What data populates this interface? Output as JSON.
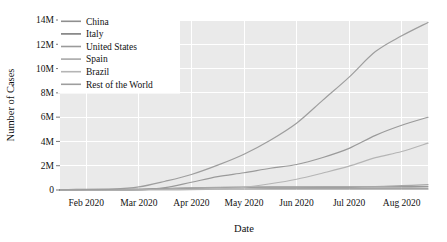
{
  "chart_data": {
    "type": "line",
    "title": "",
    "xlabel": "Date",
    "ylabel": "Number of Cases",
    "grid": true,
    "legend_position": "top-left",
    "x_tick_labels": [
      "Feb 2020",
      "Mar 2020",
      "Apr 2020",
      "May 2020",
      "Jun 2020",
      "Jul 2020",
      "Aug 2020"
    ],
    "y_tick_labels": [
      "0",
      "2M",
      "4M",
      "6M",
      "8M",
      "10M",
      "12M",
      "14M"
    ],
    "y_tick_values": [
      0,
      2000000,
      4000000,
      6000000,
      8000000,
      10000000,
      12000000,
      14000000
    ],
    "ylim": [
      0,
      14000000
    ],
    "xlim": [
      "2020-02-01",
      "2020-08-31"
    ],
    "x": [
      "2020-02-01",
      "2020-02-15",
      "2020-03-01",
      "2020-03-15",
      "2020-04-01",
      "2020-04-15",
      "2020-05-01",
      "2020-05-15",
      "2020-06-01",
      "2020-06-15",
      "2020-07-01",
      "2020-07-15",
      "2020-08-01",
      "2020-08-15",
      "2020-08-31"
    ],
    "series": [
      {
        "name": "China",
        "color": "#8f8f8f",
        "values": [
          17000,
          60000,
          80000,
          81000,
          82000,
          83000,
          83900,
          84000,
          84600,
          85000,
          85400,
          86000,
          88000,
          89500,
          90500
        ]
      },
      {
        "name": "Italy",
        "color": "#7d7d7d",
        "values": [
          3,
          3,
          1700,
          24700,
          110000,
          165000,
          205000,
          223000,
          233000,
          237000,
          241000,
          243500,
          248000,
          253000,
          268000
        ]
      },
      {
        "name": "United States",
        "color": "#9a9a9a",
        "values": [
          8,
          15,
          75,
          3500,
          189000,
          640000,
          1100000,
          1420000,
          1790000,
          2100000,
          2680000,
          3430000,
          4500000,
          5330000,
          5990000
        ]
      },
      {
        "name": "Spain",
        "color": "#a8a8a8",
        "values": [
          1,
          2,
          84,
          7800,
          104000,
          177000,
          213000,
          230000,
          239000,
          244000,
          250000,
          258000,
          288000,
          359000,
          439000
        ]
      },
      {
        "name": "Brazil",
        "color": "#b5b5b5",
        "values": [
          0,
          0,
          2,
          200,
          6800,
          28000,
          87000,
          220000,
          514000,
          888000,
          1400000,
          1960000,
          2660000,
          3170000,
          3860000
        ]
      },
      {
        "name": "Rest of the World",
        "color": "#9e9e9e",
        "values": [
          10000,
          25000,
          60000,
          250000,
          720000,
          1280000,
          2050000,
          2950000,
          4100000,
          5500000,
          7400000,
          9300000,
          11400000,
          12700000,
          13800000
        ]
      }
    ]
  }
}
